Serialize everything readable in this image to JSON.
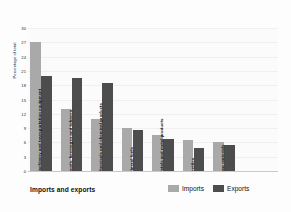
{
  "chart_data": {
    "type": "bar",
    "title": "",
    "xlabel": "Imports and exports",
    "ylabel": "Percentage of total",
    "ylim": [
      0,
      30
    ],
    "yticks": [
      0,
      3,
      6,
      9,
      12,
      15,
      18,
      21,
      24,
      27,
      30
    ],
    "grid": true,
    "legend_position": "bottom-right",
    "categories": [
      "Machinery and transportation equipment",
      "Foods, beverages and tobacco",
      "Chemicals and chemical products",
      "Mineral fuels",
      "Metals and metal products",
      "Textiles",
      "Raw materials"
    ],
    "series": [
      {
        "name": "Imports",
        "color": "#a9a9a9",
        "values": [
          27,
          13,
          11,
          9,
          7.5,
          6.5,
          6
        ]
      },
      {
        "name": "Exports",
        "color": "#4d4d4d",
        "values": [
          20,
          19.5,
          18.5,
          8.5,
          6.8,
          4.8,
          5.5
        ]
      }
    ]
  },
  "legend": {
    "items": [
      {
        "label": "Imports",
        "color": "#a9a9a9"
      },
      {
        "label": "Exports",
        "color": "#4d4d4d"
      }
    ]
  }
}
